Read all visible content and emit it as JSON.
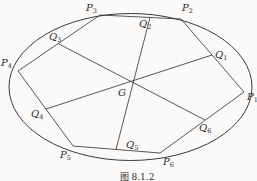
{
  "figure": {
    "caption": "图 8.1.2",
    "center_label": {
      "main": "G",
      "sub": ""
    },
    "vertex_labels": {
      "P1": {
        "main": "P",
        "sub": "1"
      },
      "P2": {
        "main": "P",
        "sub": "2"
      },
      "P3": {
        "main": "P",
        "sub": "3"
      },
      "P4": {
        "main": "P",
        "sub": "4"
      },
      "P5": {
        "main": "P",
        "sub": "5"
      },
      "P6": {
        "main": "P",
        "sub": "6"
      },
      "Q1": {
        "main": "Q",
        "sub": "1"
      },
      "Q2": {
        "main": "Q",
        "sub": "2"
      },
      "Q3": {
        "main": "Q",
        "sub": "3"
      },
      "Q4": {
        "main": "Q",
        "sub": "4"
      },
      "Q5": {
        "main": "Q",
        "sub": "5"
      },
      "Q6": {
        "main": "Q",
        "sub": "6"
      }
    }
  },
  "colors": {
    "line": "#3a3a3a",
    "text": "#2b2b2b",
    "background": "#fbfaf8"
  }
}
